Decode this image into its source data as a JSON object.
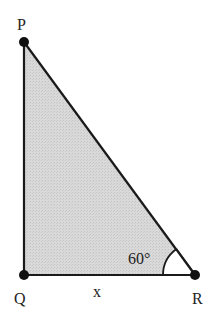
{
  "diagram": {
    "type": "right-triangle",
    "vertices": {
      "P": {
        "label": "P",
        "x": 24,
        "y": 42
      },
      "Q": {
        "label": "Q",
        "x": 24,
        "y": 275
      },
      "R": {
        "label": "R",
        "x": 195,
        "y": 275
      }
    },
    "right_angle_at": "Q",
    "side_labels": {
      "QR": "x"
    },
    "angle_labels": {
      "R": "60°"
    },
    "colors": {
      "fill": "#d6d6d6",
      "stroke": "#1a1a1a",
      "point": "#111111",
      "background": "#ffffff"
    }
  }
}
